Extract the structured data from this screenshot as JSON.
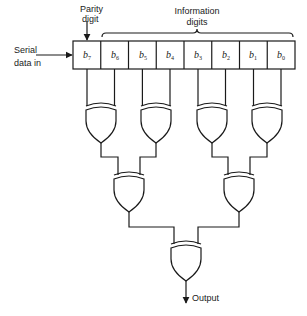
{
  "diagram": {
    "labels": {
      "parity_line1": "Parity",
      "parity_line2": "digit",
      "info_line1": "Information",
      "info_line2": "digits",
      "serial_line1": "Serial",
      "serial_line2": "data in",
      "output": "Output"
    },
    "register_cells": [
      {
        "var": "b",
        "sub": "7"
      },
      {
        "var": "b",
        "sub": "6"
      },
      {
        "var": "b",
        "sub": "5"
      },
      {
        "var": "b",
        "sub": "4"
      },
      {
        "var": "b",
        "sub": "3"
      },
      {
        "var": "b",
        "sub": "2"
      },
      {
        "var": "b",
        "sub": "1"
      },
      {
        "var": "b",
        "sub": "0"
      }
    ],
    "gates": {
      "level1": [
        "XOR(b7,b6)",
        "XOR(b5,b4)",
        "XOR(b3,b2)",
        "XOR(b1,b0)"
      ],
      "level2": [
        "XOR(L1a,L1b)",
        "XOR(L1c,L1d)"
      ],
      "level3": [
        "XOR(L2a,L2b)"
      ]
    },
    "colors": {
      "stroke": "#1a1a1a",
      "background": "#ffffff"
    }
  }
}
